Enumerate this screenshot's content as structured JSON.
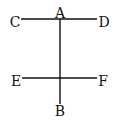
{
  "diagram": {
    "points": {
      "A": "A",
      "B": "B",
      "C": "C",
      "D": "D",
      "E": "E",
      "F": "F"
    },
    "segments": [
      {
        "from": "C",
        "to": "D"
      },
      {
        "from": "E",
        "to": "F"
      },
      {
        "from": "A",
        "to": "B"
      }
    ],
    "line_color": "#111111"
  }
}
